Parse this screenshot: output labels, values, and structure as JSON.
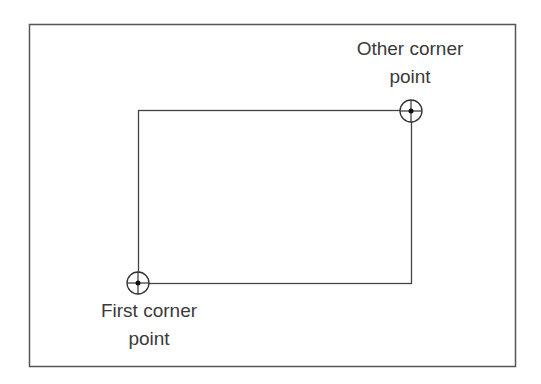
{
  "diagram": {
    "type": "rectangle-by-two-corners",
    "colors": {
      "background": "#ffffff",
      "frame": "#555555",
      "rectangle": "#444444",
      "marker": "#333333",
      "text": "#3a3a3a"
    },
    "labels": {
      "other_corner_line1": "Other corner",
      "other_corner_line2": "point",
      "first_corner_line1": "First corner",
      "first_corner_line2": "point"
    },
    "points": {
      "first_corner": {
        "x": 138,
        "y": 283
      },
      "other_corner": {
        "x": 411,
        "y": 111
      }
    }
  }
}
